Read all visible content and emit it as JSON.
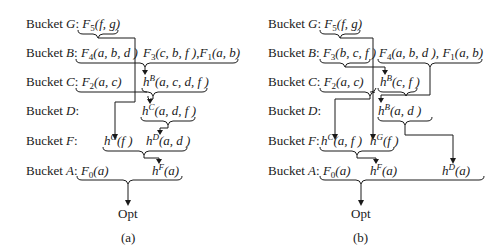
{
  "figure": {
    "panels": [
      {
        "caption": "(a)",
        "buckets": [
          {
            "label": "Bucket G:",
            "functions": [
              "F5(f, g)"
            ]
          },
          {
            "label": "Bucket B:",
            "functions": [
              "F4(a, b, d)",
              "F3(c, b, f), F1(a, b)"
            ]
          },
          {
            "label": "Bucket C:",
            "functions": [
              "F2(a, c)",
              "hB(a, c, d, f)"
            ]
          },
          {
            "label": "Bucket D:",
            "functions": [
              "hC(a, d, f)"
            ]
          },
          {
            "label": "Bucket F:",
            "functions": [
              "hG(f)",
              "hD(a, d)"
            ]
          },
          {
            "label": "Bucket A:",
            "functions": [
              "F0(a)",
              "hF(a)"
            ]
          }
        ],
        "result": "Opt"
      },
      {
        "caption": "(b)",
        "buckets": [
          {
            "label": "Bucket G:",
            "functions": [
              "F5(f, g)"
            ]
          },
          {
            "label": "Bucket B:",
            "functions": [
              "F3(b, c, f)",
              "F4(a, b, d), F1(a, b)"
            ]
          },
          {
            "label": "Bucket C:",
            "functions": [
              "F2(a, c)",
              "hB(c, f)"
            ]
          },
          {
            "label": "Bucket D:",
            "functions": [
              "hB(a, d)"
            ]
          },
          {
            "label": "Bucket F:",
            "functions": [
              "hC(a, f)",
              "hG(f)"
            ]
          },
          {
            "label": "Bucket A:",
            "functions": [
              "F0(a)",
              "hF(a)",
              "hD(a)"
            ]
          }
        ],
        "result": "Opt"
      }
    ]
  },
  "a": {
    "G": {
      "label": "Bucket ",
      "var": "G",
      "colon": ":",
      "f": "F",
      "sub": "5",
      "args": "(f, g)"
    },
    "B": {
      "label": "Bucket ",
      "var": "B",
      "colon": ":",
      "f1": "F",
      "s1": "4",
      "a1": "(a, b, d )",
      "f2": "F",
      "s2": "3",
      "a2": "(c, b, f ),",
      "f3": "F",
      "s3": "1",
      "a3": "(a, b)"
    },
    "C": {
      "label": "Bucket ",
      "var": "C",
      "colon": ":",
      "f1": "F",
      "s1": "2",
      "a1": "(a, c)",
      "h": "h",
      "sup": "B",
      "a2": "(a, c, d, f )"
    },
    "D": {
      "label": "Bucket ",
      "var": "D",
      "colon": ":",
      "h": "h",
      "sup": "C",
      "a1": "(a, d, f )"
    },
    "F": {
      "label": "Bucket ",
      "var": "F",
      "colon": ":",
      "h1": "h",
      "sup1": "G",
      "a1": "(f )",
      "h2": "h",
      "sup2": "D",
      "a2": "(a, d )"
    },
    "A": {
      "label": "Bucket ",
      "var": "A",
      "colon": ":",
      "f1": "F",
      "s1": "0",
      "a1": "(a)",
      "h": "h",
      "sup": "F",
      "a2": "(a)"
    },
    "opt": "Opt",
    "caption": "(a)"
  },
  "b": {
    "G": {
      "label": "Bucket ",
      "var": "G",
      "colon": ":",
      "f": "F",
      "sub": "5",
      "args": "(f, g)"
    },
    "B": {
      "label": "Bucket ",
      "var": "B",
      "colon": ":",
      "f1": "F",
      "s1": "3",
      "a1": "(b, c, f )",
      "f2": "F",
      "s2": "4",
      "a2": "(a, b, d ),",
      "f3": "F",
      "s3": "1",
      "a3": "(a, b)"
    },
    "C": {
      "label": "Bucket ",
      "var": "C",
      "colon": ":",
      "f1": "F",
      "s1": "2",
      "a1": "(a, c)",
      "h": "h",
      "sup": "B",
      "a2": "(c, f )"
    },
    "D": {
      "label": "Bucket ",
      "var": "D",
      "colon": ":",
      "h": "h",
      "sup": "B",
      "a1": "(a, d )"
    },
    "F": {
      "label": "Bucket ",
      "var": "F",
      "colon": ":",
      "h1": "h",
      "sup1": "C",
      "a1": "(a, f )",
      "h2": "h",
      "sup2": "G",
      "a2": "(f )"
    },
    "A": {
      "label": "Bucket ",
      "var": "A",
      "colon": ":",
      "f1": "F",
      "s1": "0",
      "a1": "(a)",
      "h": "h",
      "sup": "F",
      "a2": "(a)",
      "h3": "h",
      "sup3": "D",
      "a3": "(a)"
    },
    "opt": "Opt",
    "caption": "(b)"
  }
}
